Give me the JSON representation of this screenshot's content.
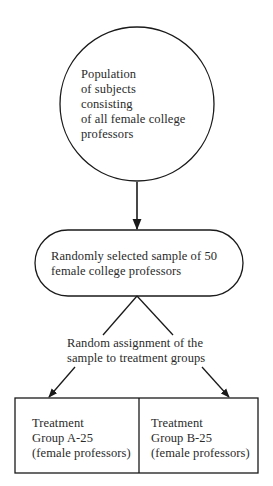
{
  "diagram": {
    "population": {
      "lines": [
        "Population",
        "of subjects",
        "consisting",
        "of all female college",
        "professors"
      ]
    },
    "sample": {
      "lines": [
        "Randomly selected sample of 50",
        "female college professors"
      ]
    },
    "assignment": {
      "lines": [
        "Random assignment of the",
        "sample to treatment groups"
      ]
    },
    "groups": [
      {
        "lines": [
          "Treatment",
          "Group A-25",
          "(female professors)"
        ]
      },
      {
        "lines": [
          "Treatment",
          "Group B-25",
          "(female professors)"
        ]
      }
    ],
    "colors": {
      "stroke": "#1a1a1a",
      "text": "#2a2a2a",
      "background": "#ffffff"
    }
  }
}
